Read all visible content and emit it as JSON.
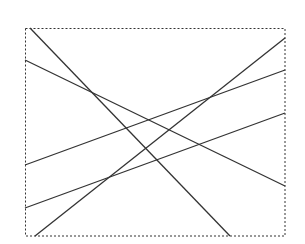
{
  "diagram": {
    "frame_style": "dashed",
    "line_color": "#333333",
    "line_count": 5,
    "lines": [
      {
        "id": "line-1",
        "from_side": "top",
        "to_side": "bottom",
        "direction": "descending"
      },
      {
        "id": "line-2",
        "from_side": "left",
        "to_side": "right",
        "direction": "descending"
      },
      {
        "id": "line-3",
        "from_side": "left",
        "to_side": "right",
        "direction": "ascending"
      },
      {
        "id": "line-4",
        "from_side": "left",
        "to_side": "right",
        "direction": "ascending"
      },
      {
        "id": "line-5",
        "from_side": "bottom",
        "to_side": "right",
        "direction": "ascending"
      }
    ]
  }
}
